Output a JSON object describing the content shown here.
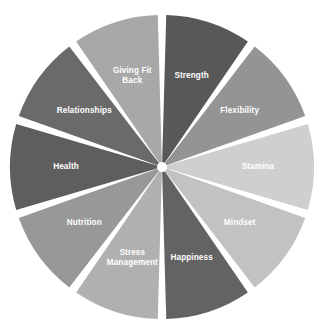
{
  "chart_data": {
    "type": "pie",
    "title": "",
    "subtitle": "",
    "xlabel": "",
    "ylabel": "",
    "legend_position": "none",
    "grid": false,
    "labels_inside_slices": true,
    "background_color": "#ffffff",
    "gap_color": "#ffffff",
    "center_hub_color": "#ffffff",
    "start_angle_deg": 0,
    "direction": "clockwise",
    "slice_gap_deg": 3.2,
    "categories": [
      "Strength",
      "Flexibility",
      "Stamina",
      "Mindset",
      "Happiness",
      "Stress Management",
      "Nutrition",
      "Health",
      "Relationships",
      "Giving Fit Back"
    ],
    "values": [
      10,
      10,
      10,
      10,
      10,
      10,
      10,
      10,
      10,
      10
    ],
    "colors": [
      "#585858",
      "#949494",
      "#cfcfcf",
      "#c2c2c2",
      "#636363",
      "#b0b0b0",
      "#989898",
      "#5e5e5e",
      "#6a6a6a",
      "#a8a8a8"
    ],
    "label_color": "#ffffff",
    "slices": [
      {
        "label": "Strength",
        "lines": [
          "Strength"
        ],
        "value": 10,
        "color": "#585858",
        "start_deg": 0,
        "end_deg": 36
      },
      {
        "label": "Flexibility",
        "lines": [
          "Flexibility"
        ],
        "value": 10,
        "color": "#949494",
        "start_deg": 36,
        "end_deg": 72
      },
      {
        "label": "Stamina",
        "lines": [
          "Stamina"
        ],
        "value": 10,
        "color": "#cfcfcf",
        "start_deg": 72,
        "end_deg": 108
      },
      {
        "label": "Mindset",
        "lines": [
          "Mindset"
        ],
        "value": 10,
        "color": "#c2c2c2",
        "start_deg": 108,
        "end_deg": 144
      },
      {
        "label": "Happiness",
        "lines": [
          "Happiness"
        ],
        "value": 10,
        "color": "#636363",
        "start_deg": 144,
        "end_deg": 180
      },
      {
        "label": "Stress Management",
        "lines": [
          "Stress",
          "Management"
        ],
        "value": 10,
        "color": "#b0b0b0",
        "start_deg": 180,
        "end_deg": 216
      },
      {
        "label": "Nutrition",
        "lines": [
          "Nutrition"
        ],
        "value": 10,
        "color": "#989898",
        "start_deg": 216,
        "end_deg": 252
      },
      {
        "label": "Health",
        "lines": [
          "Health"
        ],
        "value": 10,
        "color": "#5e5e5e",
        "start_deg": 252,
        "end_deg": 288
      },
      {
        "label": "Relationships",
        "lines": [
          "Relationships"
        ],
        "value": 10,
        "color": "#6a6a6a",
        "start_deg": 288,
        "end_deg": 324
      },
      {
        "label": "Giving Fit Back",
        "lines": [
          "Giving Fit",
          "Back"
        ],
        "value": 10,
        "color": "#a8a8a8",
        "start_deg": 324,
        "end_deg": 360
      }
    ],
    "geometry": {
      "center_x": 162,
      "center_y": 167,
      "radius": 152,
      "inner_radius": 5,
      "label_radius": 96
    }
  }
}
